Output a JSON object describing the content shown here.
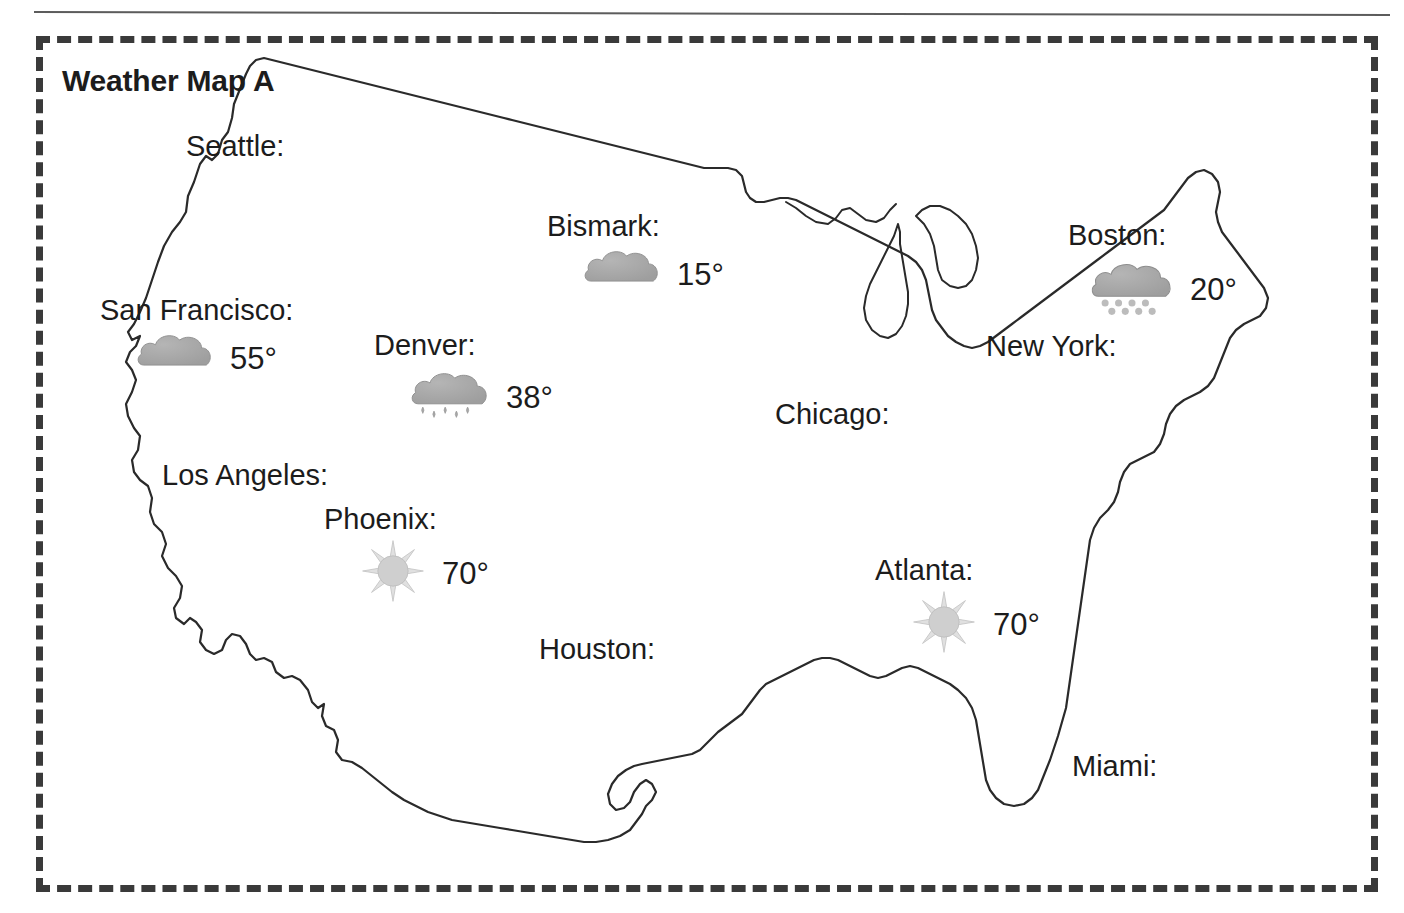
{
  "page": {
    "title": "Weather Map A",
    "frame_style": "dashed",
    "frame_color": "#3a3a3a",
    "background_color": "#ffffff",
    "ink_color": "#1c1c1c"
  },
  "map": {
    "region_name": "United States",
    "outline_color": "#2a2a2a",
    "fill_color": "#ffffff"
  },
  "legend_colors": {
    "cloud": "#9e9e9e",
    "cloud_shade": "#b5b5b5",
    "sun": "#cfcfcf",
    "sun_outline": "#bdbdbd",
    "rain": "#a8a8a8",
    "snow": "#bcbcbc"
  },
  "cities": [
    {
      "id": "seattle",
      "label": "Seattle:",
      "icon": null,
      "temperature": null,
      "x": 186,
      "y": 132,
      "layout": "none"
    },
    {
      "id": "bismark",
      "label": "Bismark:",
      "icon": "cloud-icon",
      "temperature": "15°",
      "x": 547,
      "y": 212,
      "layout": "indent-left"
    },
    {
      "id": "boston",
      "label": "Boston:",
      "icon": "snow-cloud-icon",
      "temperature": "20°",
      "x": 1068,
      "y": 221,
      "layout": "indent-mid"
    },
    {
      "id": "san-francisco",
      "label": "San Francisco:",
      "icon": "cloud-icon",
      "temperature": "55°",
      "x": 100,
      "y": 296,
      "layout": "indent-left"
    },
    {
      "id": "new-york",
      "label": "New York:",
      "icon": null,
      "temperature": null,
      "x": 986,
      "y": 332,
      "layout": "none"
    },
    {
      "id": "denver",
      "label": "Denver:",
      "icon": "rain-cloud-icon",
      "temperature": "38°",
      "x": 374,
      "y": 331,
      "layout": "indent-left"
    },
    {
      "id": "chicago",
      "label": "Chicago:",
      "icon": null,
      "temperature": null,
      "x": 775,
      "y": 400,
      "layout": "none"
    },
    {
      "id": "los-angeles",
      "label": "Los Angeles:",
      "icon": null,
      "temperature": null,
      "x": 162,
      "y": 461,
      "layout": "none"
    },
    {
      "id": "phoenix",
      "label": "Phoenix:",
      "icon": "sun-icon",
      "temperature": "70°",
      "x": 324,
      "y": 505,
      "layout": "indent-left"
    },
    {
      "id": "atlanta",
      "label": "Atlanta:",
      "icon": "sun-icon",
      "temperature": "70°",
      "x": 875,
      "y": 556,
      "layout": "indent-left"
    },
    {
      "id": "houston",
      "label": "Houston:",
      "icon": null,
      "temperature": null,
      "x": 539,
      "y": 635,
      "layout": "none"
    },
    {
      "id": "miami",
      "label": "Miami:",
      "icon": null,
      "temperature": null,
      "x": 1072,
      "y": 752,
      "layout": "none"
    }
  ]
}
